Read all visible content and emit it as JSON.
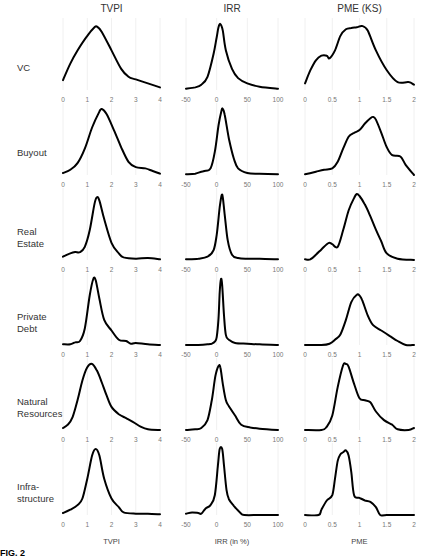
{
  "figure": {
    "column_titles": [
      "TVPI",
      "IRR",
      "PME (KS)"
    ],
    "row_labels": [
      "VC",
      "Buyout",
      "Real\nEstate",
      "Private\nDebt",
      "Natural\nResources",
      "Infra-\nstructure"
    ],
    "bottom_labels": [
      "TVPI",
      "IRR (in %)",
      "PME"
    ],
    "fig_label": "FIG. 2"
  },
  "chart_data": [
    {
      "type": "line",
      "title": "Kernel density panels by asset class",
      "columns": [
        {
          "metric": "TVPI",
          "xlim": [
            0,
            4
          ],
          "ticks": [
            "0",
            "1",
            "2",
            "3",
            "4"
          ],
          "xlabel": "TVPI"
        },
        {
          "metric": "IRR",
          "xlim": [
            -50,
            100
          ],
          "ticks": [
            "-50",
            "0",
            "50",
            "100"
          ],
          "xlabel": "IRR (in %)"
        },
        {
          "metric": "PME (KS)",
          "xlim": [
            0,
            2
          ],
          "ticks": [
            "0",
            "0.5",
            "1",
            "1.5",
            "2"
          ],
          "xlabel": "PME"
        }
      ],
      "grid": "vertical, light",
      "ylabel": "",
      "rows": [
        {
          "name": "VC",
          "TVPI": {
            "x": [
              0,
              0.3,
              0.6,
              1.0,
              1.3,
              1.4,
              1.6,
              2.0,
              2.4,
              2.7,
              3.0,
              3.5,
              4.0
            ],
            "y": [
              0.15,
              0.4,
              0.6,
              0.82,
              0.95,
              0.96,
              0.88,
              0.6,
              0.32,
              0.2,
              0.16,
              0.1,
              0.04
            ]
          },
          "IRR": {
            "x": [
              -50,
              -35,
              -25,
              -15,
              -5,
              0,
              3,
              6,
              10,
              15,
              25,
              35,
              50,
              70,
              100
            ],
            "y": [
              0.02,
              0.04,
              0.08,
              0.2,
              0.55,
              0.8,
              0.95,
              1.0,
              0.9,
              0.6,
              0.32,
              0.18,
              0.1,
              0.05,
              0.02
            ]
          },
          "PME": {
            "x": [
              0,
              0.1,
              0.2,
              0.3,
              0.4,
              0.45,
              0.55,
              0.65,
              0.75,
              0.85,
              0.95,
              1.05,
              1.15,
              1.3,
              1.5,
              1.7,
              1.9,
              2.0
            ],
            "y": [
              0.1,
              0.3,
              0.45,
              0.52,
              0.52,
              0.48,
              0.6,
              0.82,
              0.92,
              0.94,
              0.95,
              0.97,
              0.9,
              0.6,
              0.3,
              0.12,
              0.12,
              0.08
            ]
          }
        },
        {
          "name": "Buyout",
          "TVPI": {
            "x": [
              0,
              0.3,
              0.6,
              0.9,
              1.2,
              1.5,
              1.6,
              1.8,
              2.1,
              2.4,
              2.7,
              3.0,
              3.4,
              3.7,
              4.0
            ],
            "y": [
              0.03,
              0.08,
              0.18,
              0.4,
              0.72,
              0.96,
              1.0,
              0.92,
              0.68,
              0.42,
              0.2,
              0.12,
              0.1,
              0.06,
              0.02
            ]
          },
          "IRR": {
            "x": [
              -50,
              -35,
              -25,
              -20,
              -10,
              -3,
              3,
              8,
              10,
              13,
              20,
              28,
              35,
              50,
              70,
              100
            ],
            "y": [
              0.01,
              0.02,
              0.05,
              0.06,
              0.1,
              0.35,
              0.75,
              0.98,
              1.0,
              0.92,
              0.55,
              0.25,
              0.1,
              0.03,
              0.02,
              0.01
            ]
          },
          "PME": {
            "x": [
              0,
              0.2,
              0.35,
              0.5,
              0.6,
              0.7,
              0.8,
              0.9,
              1.0,
              1.1,
              1.2,
              1.25,
              1.3,
              1.4,
              1.5,
              1.6,
              1.75,
              1.85,
              2.0
            ],
            "y": [
              0.01,
              0.05,
              0.08,
              0.1,
              0.2,
              0.4,
              0.58,
              0.64,
              0.68,
              0.78,
              0.86,
              0.88,
              0.84,
              0.64,
              0.42,
              0.3,
              0.28,
              0.15,
              0.0
            ]
          }
        },
        {
          "name": "Real Estate",
          "TVPI": {
            "x": [
              0,
              0.3,
              0.5,
              0.7,
              0.9,
              1.1,
              1.3,
              1.4,
              1.5,
              1.7,
              2.0,
              2.3,
              2.5,
              3.0,
              3.5,
              4.0
            ],
            "y": [
              0.05,
              0.1,
              0.12,
              0.12,
              0.2,
              0.45,
              0.85,
              0.95,
              0.9,
              0.62,
              0.26,
              0.1,
              0.04,
              0.02,
              0.03,
              0.01
            ]
          },
          "IRR": {
            "x": [
              -50,
              -30,
              -15,
              -5,
              0,
              5,
              8,
              10,
              13,
              18,
              25,
              35,
              50,
              70,
              100
            ],
            "y": [
              0.01,
              0.02,
              0.05,
              0.15,
              0.38,
              0.8,
              0.98,
              0.95,
              0.7,
              0.3,
              0.08,
              0.03,
              0.02,
              0.02,
              0.01
            ]
          },
          "PME": {
            "x": [
              0,
              0.1,
              0.2,
              0.3,
              0.4,
              0.45,
              0.5,
              0.6,
              0.7,
              0.8,
              0.9,
              0.95,
              1.0,
              1.1,
              1.2,
              1.3,
              1.4,
              1.5,
              1.7,
              2.0
            ],
            "y": [
              0.01,
              0.01,
              0.08,
              0.16,
              0.24,
              0.26,
              0.24,
              0.2,
              0.45,
              0.75,
              0.94,
              1.0,
              0.97,
              0.84,
              0.66,
              0.46,
              0.28,
              0.1,
              0.02,
              0.0
            ]
          }
        },
        {
          "name": "Private Debt",
          "TVPI": {
            "x": [
              0,
              0.3,
              0.5,
              0.7,
              0.9,
              1.1,
              1.25,
              1.35,
              1.5,
              1.7,
              2.0,
              2.3,
              2.6,
              2.8,
              3.0,
              3.5,
              4.0
            ],
            "y": [
              0.01,
              0.01,
              0.04,
              0.06,
              0.25,
              0.75,
              1.0,
              0.98,
              0.7,
              0.38,
              0.22,
              0.08,
              0.06,
              0.02,
              0.03,
              0.01,
              0.0
            ]
          },
          "IRR": {
            "x": [
              -50,
              -30,
              -15,
              -8,
              -3,
              0,
              3,
              5,
              7,
              9,
              12,
              15,
              20,
              30,
              50,
              70,
              100
            ],
            "y": [
              0.0,
              0.0,
              0.01,
              0.02,
              0.05,
              0.12,
              0.4,
              0.8,
              1.0,
              0.9,
              0.45,
              0.15,
              0.08,
              0.03,
              0.02,
              0.01,
              0.0
            ]
          },
          "PME": {
            "x": [
              0,
              0.3,
              0.45,
              0.55,
              0.65,
              0.75,
              0.85,
              0.95,
              1.0,
              1.05,
              1.15,
              1.25,
              1.4,
              1.55,
              1.7,
              1.85,
              2.0
            ],
            "y": [
              0.0,
              0.0,
              0.02,
              0.08,
              0.16,
              0.38,
              0.65,
              0.76,
              0.75,
              0.68,
              0.45,
              0.3,
              0.22,
              0.14,
              0.06,
              0.0,
              0.0
            ]
          }
        },
        {
          "name": "Natural Resources",
          "TVPI": {
            "x": [
              0,
              0.2,
              0.4,
              0.6,
              0.8,
              1.0,
              1.2,
              1.4,
              1.6,
              1.8,
              2.0,
              2.3,
              2.6,
              2.9,
              3.2,
              3.5,
              4.0
            ],
            "y": [
              0.03,
              0.08,
              0.2,
              0.45,
              0.75,
              0.95,
              1.0,
              0.9,
              0.72,
              0.52,
              0.35,
              0.24,
              0.18,
              0.12,
              0.05,
              0.01,
              0.0
            ]
          },
          "IRR": {
            "x": [
              -50,
              -35,
              -25,
              -15,
              -8,
              -2,
              3,
              6,
              10,
              15,
              20,
              30,
              40,
              55,
              70,
              100
            ],
            "y": [
              0.0,
              0.01,
              0.03,
              0.15,
              0.45,
              0.82,
              0.97,
              0.95,
              0.7,
              0.45,
              0.36,
              0.22,
              0.08,
              0.04,
              0.02,
              0.0
            ]
          },
          "PME": {
            "x": [
              0,
              0.3,
              0.4,
              0.5,
              0.6,
              0.7,
              0.75,
              0.8,
              0.9,
              1.0,
              1.1,
              1.2,
              1.3,
              1.45,
              1.6,
              1.7,
              1.9,
              2.0
            ],
            "y": [
              0.0,
              0.0,
              0.05,
              0.22,
              0.65,
              0.98,
              1.0,
              0.96,
              0.7,
              0.48,
              0.45,
              0.42,
              0.28,
              0.15,
              0.08,
              0.01,
              0.0,
              0.03
            ]
          }
        },
        {
          "name": "Infrastructure",
          "TVPI": {
            "x": [
              0,
              0.3,
              0.6,
              0.8,
              1.0,
              1.2,
              1.35,
              1.5,
              1.7,
              2.0,
              2.3,
              2.5,
              3.0,
              3.5,
              4.0
            ],
            "y": [
              0.03,
              0.08,
              0.15,
              0.25,
              0.55,
              0.9,
              1.0,
              0.9,
              0.55,
              0.25,
              0.12,
              0.04,
              0.02,
              0.02,
              0.01
            ]
          },
          "IRR": {
            "x": [
              -50,
              -40,
              -30,
              -25,
              -18,
              -10,
              -3,
              2,
              5,
              9,
              12,
              16,
              20,
              28,
              38,
              45,
              70,
              100
            ],
            "y": [
              0.02,
              0.04,
              0.03,
              0.02,
              0.1,
              0.15,
              0.3,
              0.75,
              1.0,
              1.0,
              0.75,
              0.38,
              0.24,
              0.14,
              0.04,
              0.0,
              0.0,
              0.0
            ]
          },
          "PME": {
            "x": [
              0,
              0.25,
              0.3,
              0.4,
              0.5,
              0.55,
              0.6,
              0.65,
              0.7,
              0.75,
              0.8,
              0.85,
              0.9,
              1.0,
              1.1,
              1.2,
              1.3,
              1.38,
              1.5,
              2.0
            ],
            "y": [
              0.0,
              0.0,
              0.08,
              0.22,
              0.3,
              0.55,
              0.82,
              0.92,
              0.95,
              0.98,
              0.9,
              0.65,
              0.3,
              0.26,
              0.22,
              0.2,
              0.12,
              0.0,
              0.0,
              0.0
            ]
          }
        }
      ]
    }
  ]
}
